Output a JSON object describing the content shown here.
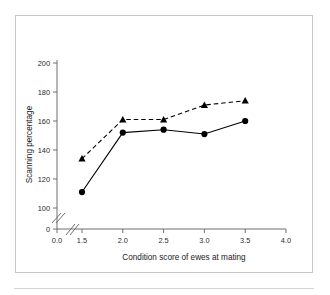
{
  "figure": {
    "frame_color": "#c9c9c9",
    "background": "#ffffff"
  },
  "chart_data": {
    "type": "line",
    "title": "",
    "xlabel": "Condition score of ewes at mating",
    "ylabel": "Scanning percentage",
    "x": [
      1.5,
      2.0,
      2.5,
      3.0,
      3.5
    ],
    "xlim": [
      1.5,
      4.0
    ],
    "ylim": [
      100,
      205
    ],
    "grid": false,
    "legend": "none",
    "x_axis_break": true,
    "y_axis_break": true,
    "x_tick_labels": [
      "0.0",
      "1.5",
      "2.0",
      "2.5",
      "3.0",
      "3.5",
      "4.0"
    ],
    "x_tick_values": [
      0.0,
      1.5,
      2.0,
      2.5,
      3.0,
      3.5,
      4.0
    ],
    "y_tick_labels": [
      "0",
      "100",
      "120",
      "140",
      "160",
      "180",
      "200"
    ],
    "y_tick_values": [
      0,
      100,
      120,
      140,
      160,
      180,
      200
    ],
    "series": [
      {
        "name": "dashed-triangle-series",
        "marker": "triangle",
        "line_style": "dashed",
        "color": "#000000",
        "values": [
          134,
          161,
          161,
          171,
          174
        ]
      },
      {
        "name": "solid-circle-series",
        "marker": "circle",
        "line_style": "solid",
        "color": "#000000",
        "values": [
          111,
          152,
          154,
          151,
          160
        ]
      }
    ]
  }
}
